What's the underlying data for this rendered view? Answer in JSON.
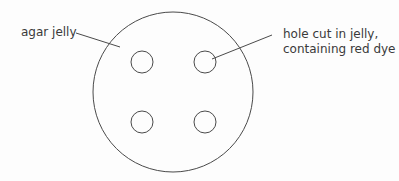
{
  "diagram": {
    "type": "agar plate with wells",
    "labels": {
      "agar": "agar jelly",
      "hole_line1": "hole cut in jelly,",
      "hole_line2": "containing red dye"
    },
    "plate": {
      "cx": 173,
      "cy": 92,
      "r": 80
    },
    "holes": [
      {
        "cx": 142,
        "cy": 62,
        "r": 11
      },
      {
        "cx": 205,
        "cy": 62,
        "r": 11
      },
      {
        "cx": 142,
        "cy": 122,
        "r": 11
      },
      {
        "cx": 205,
        "cy": 122,
        "r": 11
      }
    ],
    "colors": {
      "stroke": "#4a4a4a",
      "text": "#3a3a3a",
      "background": "#fdfdfd"
    }
  }
}
